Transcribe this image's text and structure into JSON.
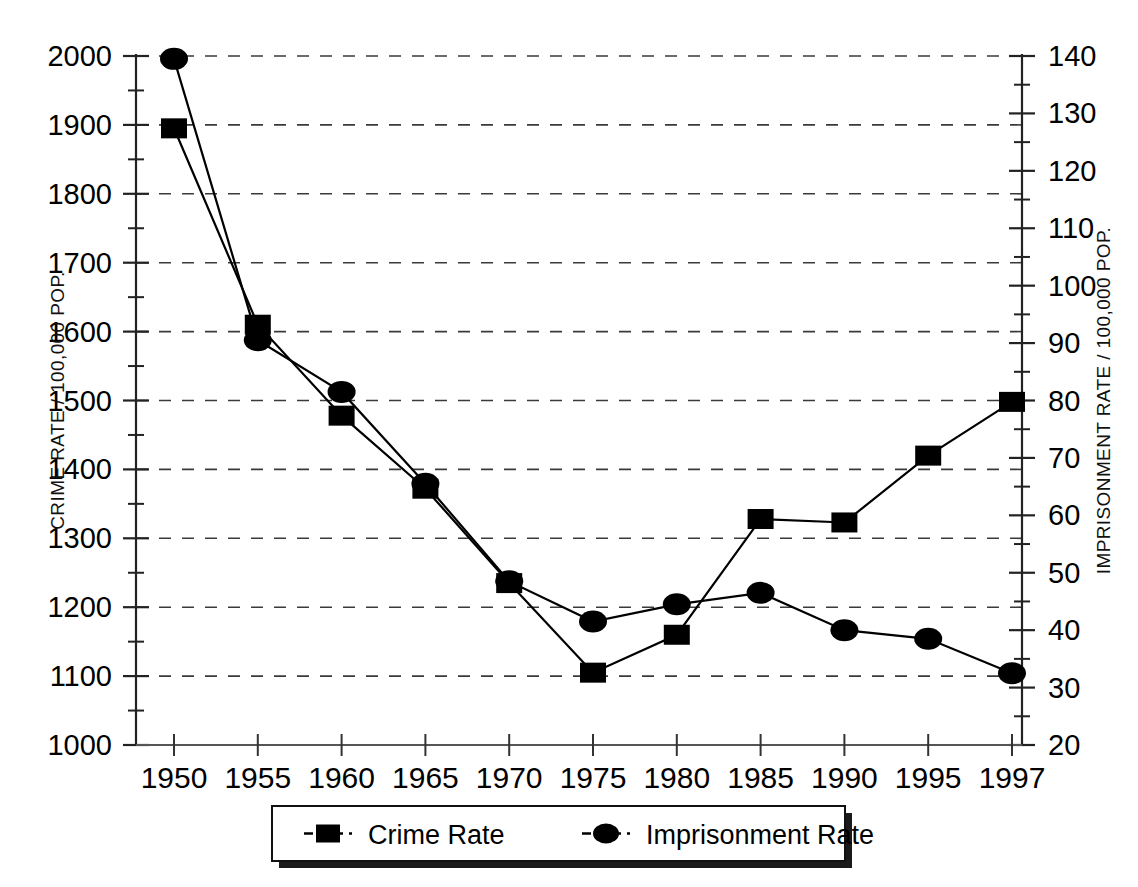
{
  "chart_data": {
    "type": "line",
    "title": "",
    "subtitle": "",
    "xlabel": "",
    "ylabel": "CRIME RATE / 100,000 POP.",
    "y2label": "IMPRISONMENT RATE / 100,000 POP.",
    "grid": true,
    "legend_position": "bottom-center",
    "categories": [
      "1950",
      "1955",
      "1960",
      "1965",
      "1970",
      "1975",
      "1980",
      "1985",
      "1990",
      "1995",
      "1997"
    ],
    "x_tick_labels": [
      "1950",
      "1955",
      "1960",
      "1965",
      "1970",
      "1975",
      "1980",
      "1985",
      "1990",
      "1995",
      "1997"
    ],
    "y_tick_labels": [
      "1000",
      "1100",
      "1200",
      "1300",
      "1400",
      "1500",
      "1600",
      "1700",
      "1800",
      "1900",
      "2000"
    ],
    "y2_tick_labels": [
      "20",
      "30",
      "40",
      "50",
      "60",
      "70",
      "80",
      "90",
      "100",
      "110",
      "120",
      "130",
      "140"
    ],
    "ylim": [
      1000,
      2000
    ],
    "y2lim": [
      20,
      140
    ],
    "y_tick_step": 100,
    "y2_tick_step": 10,
    "series": [
      {
        "name": "Crime Rate",
        "axis": "left",
        "marker": "square",
        "color": "#000000",
        "values": [
          1895,
          1610,
          1478,
          1372,
          1235,
          1105,
          1160,
          1328,
          1323,
          1420,
          1498
        ]
      },
      {
        "name": "Imprisonment Rate",
        "axis": "right",
        "marker": "circle",
        "color": "#000000",
        "values": [
          139.5,
          90.5,
          81.5,
          65.5,
          48.5,
          41.5,
          44.5,
          46.5,
          40.0,
          38.5,
          32.5
        ]
      }
    ],
    "legend": [
      {
        "label": "Crime Rate",
        "marker": "square"
      },
      {
        "label": "Imprisonment Rate",
        "marker": "circle"
      }
    ]
  }
}
